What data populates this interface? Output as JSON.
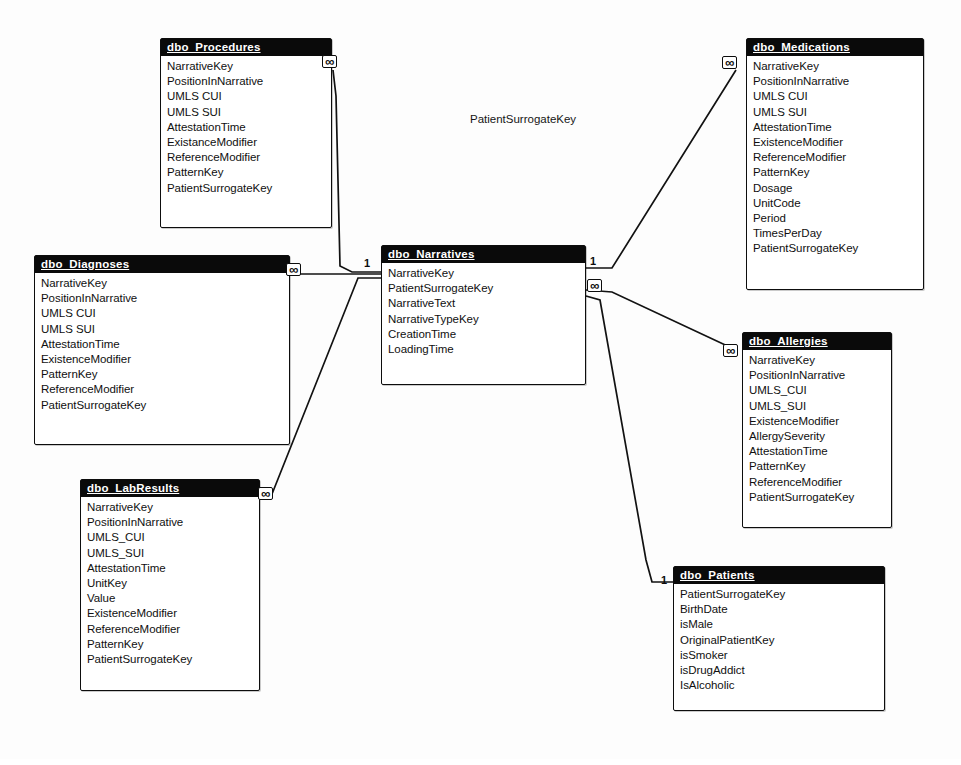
{
  "diagram": {
    "type": "entity-relationship",
    "floating_label": "PatientSurrogateKey",
    "cardinality_one": "1",
    "cardinality_many": "∞"
  },
  "entities": [
    {
      "id": "procedures",
      "title": "dbo_Procedures",
      "x": 160,
      "y": 38,
      "width": 172,
      "height": 190,
      "fields": [
        "NarrativeKey",
        "PositionInNarrative",
        "UMLS CUI",
        "UMLS SUI",
        "AttestationTime",
        "ExistanceModifier",
        "ReferenceModifier",
        "PatternKey",
        "PatientSurrogateKey"
      ]
    },
    {
      "id": "medications",
      "title": "dbo_Medications",
      "x": 746,
      "y": 38,
      "width": 178,
      "height": 252,
      "fields": [
        "NarrativeKey",
        "PositionInNarrative",
        "UMLS CUI",
        "UMLS SUI",
        "AttestationTime",
        "ExistenceModifier",
        "ReferenceModifier",
        "PatternKey",
        "Dosage",
        "UnitCode",
        "Period",
        "TimesPerDay",
        "PatientSurrogateKey"
      ]
    },
    {
      "id": "diagnoses",
      "title": "dbo_Diagnoses",
      "x": 34,
      "y": 255,
      "width": 256,
      "height": 190,
      "fields": [
        "NarrativeKey",
        "PositionInNarrative",
        "UMLS CUI",
        "UMLS SUI",
        "AttestationTime",
        "ExistenceModifier",
        "PatternKey",
        "ReferenceModifier",
        "PatientSurrogateKey"
      ]
    },
    {
      "id": "narratives",
      "title": "dbo_Narratives",
      "x": 381,
      "y": 245,
      "width": 205,
      "height": 140,
      "fields": [
        "NarrativeKey",
        "PatientSurrogateKey",
        "NarrativeText",
        "NarrativeTypeKey",
        "CreationTime",
        "LoadingTime"
      ]
    },
    {
      "id": "allergies",
      "title": "dbo_Allergies",
      "x": 742,
      "y": 332,
      "width": 150,
      "height": 196,
      "fields": [
        "NarrativeKey",
        "PositionInNarrative",
        "UMLS_CUI",
        "UMLS_SUI",
        "ExistenceModifier",
        "AllergySeverity",
        "AttestationTime",
        "PatternKey",
        "ReferenceModifier",
        "PatientSurrogateKey"
      ]
    },
    {
      "id": "labresults",
      "title": "dbo_LabResults",
      "x": 80,
      "y": 479,
      "width": 180,
      "height": 212,
      "fields": [
        "NarrativeKey",
        "PositionInNarrative",
        "UMLS_CUI",
        "UMLS_SUI",
        "AttestationTime",
        "UnitKey",
        "Value",
        "ExistenceModifier",
        "ReferenceModifier",
        "PatternKey",
        "PatientSurrogateKey"
      ]
    },
    {
      "id": "patients",
      "title": "dbo_Patients",
      "x": 673,
      "y": 566,
      "width": 212,
      "height": 145,
      "fields": [
        "PatientSurrogateKey",
        "BirthDate",
        "isMale",
        "OriginalPatientKey",
        "isSmoker",
        "isDrugAddict",
        "IsAlcoholic"
      ]
    }
  ],
  "relationships": [
    {
      "id": "narratives-procedures",
      "from": "dbo_Narratives",
      "to": "dbo_Procedures",
      "from_cardinality": "1",
      "to_cardinality": "∞"
    },
    {
      "id": "narratives-medications",
      "from": "dbo_Narratives",
      "to": "dbo_Medications",
      "from_cardinality": "1",
      "to_cardinality": "∞"
    },
    {
      "id": "narratives-diagnoses",
      "from": "dbo_Narratives",
      "to": "dbo_Diagnoses",
      "from_cardinality": "1",
      "to_cardinality": "∞"
    },
    {
      "id": "narratives-allergies",
      "from": "dbo_Narratives",
      "to": "dbo_Allergies",
      "from_cardinality": "∞",
      "to_cardinality": "∞"
    },
    {
      "id": "narratives-labresults",
      "from": "dbo_Narratives",
      "to": "dbo_LabResults",
      "from_cardinality": "1",
      "to_cardinality": "∞"
    },
    {
      "id": "patients-narratives",
      "from": "dbo_Patients",
      "to": "dbo_Narratives",
      "from_cardinality": "1",
      "to_cardinality": "∞"
    }
  ],
  "cardinality_markers": [
    {
      "id": "procedures-many",
      "label": "∞",
      "kind": "many",
      "x": 322,
      "y": 55
    },
    {
      "id": "medications-many",
      "label": "∞",
      "kind": "many",
      "x": 722,
      "y": 56
    },
    {
      "id": "diagnoses-many",
      "label": "∞",
      "kind": "many",
      "x": 286,
      "y": 263
    },
    {
      "id": "narratives-one-left",
      "label": "1",
      "kind": "one",
      "x": 364,
      "y": 258
    },
    {
      "id": "narratives-one-right",
      "label": "1",
      "kind": "one",
      "x": 590,
      "y": 256
    },
    {
      "id": "narratives-many-right",
      "label": "∞",
      "kind": "many",
      "x": 587,
      "y": 279
    },
    {
      "id": "allergies-many",
      "label": "∞",
      "kind": "many",
      "x": 723,
      "y": 344
    },
    {
      "id": "labresults-many",
      "label": "∞",
      "kind": "many",
      "x": 258,
      "y": 487
    },
    {
      "id": "patients-one",
      "label": "1",
      "kind": "one",
      "x": 661,
      "y": 575
    }
  ]
}
